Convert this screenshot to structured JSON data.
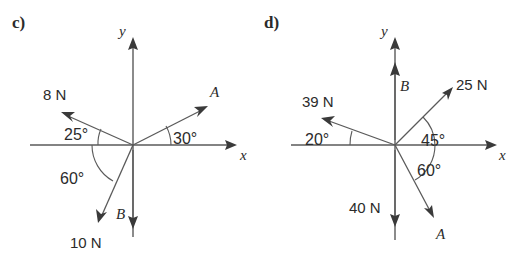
{
  "figure": {
    "background_color": "#ffffff",
    "line_color": "#5a5a5a",
    "text_color": "#2b2b2b",
    "panels": [
      {
        "id": "c",
        "label": "c)",
        "origin": [
          133,
          145
        ],
        "axes": {
          "x_label": "x",
          "y_label": "y",
          "x_start": [
            30,
            145
          ],
          "x_end": [
            237,
            145
          ],
          "y_start": [
            133,
            237
          ],
          "y_end": [
            133,
            37
          ]
        },
        "vectors": [
          {
            "name": "vector-8n",
            "magnitude_label": "8 N",
            "vector_label": "",
            "angle_label": "25°",
            "angle_deg": 25,
            "direction": "up-left from origin, 25° above negative x-axis",
            "tip": [
              63,
              113
            ],
            "magnitude_label_pos": [
              43,
              95
            ],
            "angle_label_pos": [
              68,
              139
            ]
          },
          {
            "name": "vector-a",
            "magnitude_label": "",
            "vector_label": "A",
            "angle_label": "30°",
            "angle_deg": 30,
            "direction": "up-right from origin, 30° above positive x-axis",
            "tip": [
              207,
              107
            ],
            "vector_label_pos": [
              211,
              93
            ],
            "angle_label_pos": [
              172,
              143
            ]
          },
          {
            "name": "vector-10n",
            "magnitude_label": "10 N",
            "vector_label": "",
            "angle_label": "60°",
            "angle_deg": 60,
            "direction": "down-left from origin, 60° below negative x-axis",
            "tip": [
              98,
              222
            ],
            "magnitude_label_pos": [
              72,
              243
            ],
            "angle_label_pos": [
              62,
              179
            ]
          },
          {
            "name": "vector-b",
            "magnitude_label": "",
            "vector_label": "B",
            "angle_label": "",
            "angle_deg": 270,
            "direction": "straight down along negative y-axis",
            "tip": [
              133,
              228
            ],
            "vector_label_pos": [
              120,
              215
            ]
          }
        ]
      },
      {
        "id": "d",
        "label": "d)",
        "origin": [
          395,
          145
        ],
        "axes": {
          "x_label": "x",
          "y_label": "y",
          "x_start": [
            291,
            145
          ],
          "x_end": [
            497,
            145
          ],
          "y_start": [
            395,
            240
          ],
          "y_end": [
            395,
            37
          ]
        },
        "vectors": [
          {
            "name": "vector-39n",
            "magnitude_label": "39 N",
            "vector_label": "",
            "angle_label": "20°",
            "angle_deg": 20,
            "direction": "up-left from origin, 20° above negative x-axis",
            "tip": [
              322,
              120
            ],
            "magnitude_label_pos": [
              303,
              102
            ],
            "angle_label_pos": [
              309,
              144
            ]
          },
          {
            "name": "vector-25n",
            "magnitude_label": "25 N",
            "vector_label": "",
            "angle_label": "45°",
            "angle_deg": 45,
            "direction": "up-right from origin, 45° above positive x-axis",
            "tip": [
              452,
              88
            ],
            "magnitude_label_pos": [
              458,
              85
            ],
            "angle_label_pos": [
              422,
              141
            ]
          },
          {
            "name": "vector-b",
            "magnitude_label": "",
            "vector_label": "B",
            "angle_label": "",
            "angle_deg": 90,
            "direction": "straight up along positive y-axis",
            "tip": [
              395,
              63
            ],
            "vector_label_pos": [
              401,
              85
            ]
          },
          {
            "name": "vector-40n",
            "magnitude_label": "40 N",
            "vector_label": "",
            "angle_label": "",
            "angle_deg": 270,
            "direction": "straight down along negative y-axis",
            "tip": [
              395,
              226
            ],
            "magnitude_label_pos": [
              351,
              208
            ]
          },
          {
            "name": "vector-a",
            "magnitude_label": "",
            "vector_label": "A",
            "angle_label": "60°",
            "angle_deg": 60,
            "direction": "down-right from origin, 60° below positive x-axis",
            "tip": [
              434,
              217
            ],
            "vector_label_pos": [
              437,
              233
            ],
            "angle_label_pos": [
              418,
              171
            ]
          }
        ]
      }
    ]
  }
}
